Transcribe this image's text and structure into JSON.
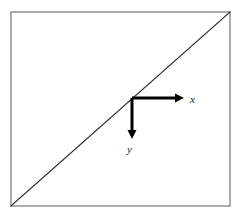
{
  "figure": {
    "canvas": {
      "width": 242,
      "height": 216,
      "background_color": "#ffffff"
    },
    "frame": {
      "name": "square-region",
      "x": 11,
      "y": 12,
      "width": 219,
      "height": 194,
      "stroke_color": "#7f7f7f",
      "stroke_width": 1.3,
      "fill": "none"
    },
    "diagonal": {
      "name": "diagonal-line",
      "from": {
        "x": 11,
        "y": 206
      },
      "to": {
        "x": 230,
        "y": 12
      },
      "stroke_color": "#262626",
      "stroke_width": 1.2,
      "description": "line from bottom-left corner to top-right corner"
    },
    "origin": {
      "x": 132,
      "y": 98
    },
    "axes": [
      {
        "name": "x-axis",
        "direction": "right",
        "from": {
          "x": 132,
          "y": 98
        },
        "to": {
          "x": 184,
          "y": 98
        },
        "label": "x",
        "label_x": 190,
        "label_y": 103,
        "stroke_color": "#000000",
        "stroke_width": 3,
        "arrowhead": true
      },
      {
        "name": "y-axis",
        "direction": "down",
        "from": {
          "x": 132,
          "y": 98
        },
        "to": {
          "x": 132,
          "y": 138
        },
        "label": "y",
        "label_x": 127,
        "label_y": 153,
        "stroke_color": "#000000",
        "stroke_width": 3,
        "arrowhead": true
      }
    ],
    "arrowhead": {
      "length": 8,
      "half_width": 4,
      "fill_color": "#000000"
    }
  }
}
